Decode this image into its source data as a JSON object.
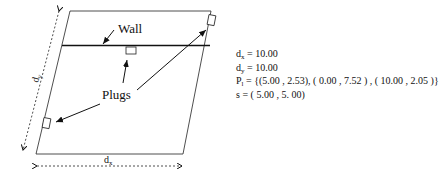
{
  "diagram": {
    "labels": {
      "wall": "Wall",
      "plugs": "Plugs",
      "dim_x": "d",
      "dim_x_sub": "x",
      "dim_y": "d",
      "dim_y_sub": "y"
    }
  },
  "parameters": {
    "dx": {
      "name": "d",
      "sub": "x",
      "value": "= 10.00"
    },
    "dy": {
      "name": "d",
      "sub": "y",
      "value": "= 10.00"
    },
    "plugs": {
      "name": "P",
      "sub": "l",
      "value": "= {(5.00 , 2.53), ( 0.00 , 7.52 ) , ( 10.00 , 2.05 )}"
    },
    "s": {
      "name": "s",
      "value": "= ( 5.00 , 5. 00)"
    }
  }
}
